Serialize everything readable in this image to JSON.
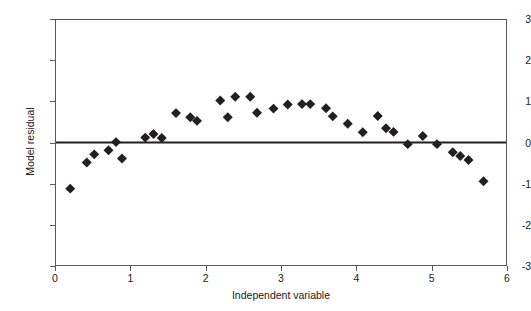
{
  "chart_data": {
    "type": "scatter",
    "title": "",
    "xlabel": "Independent variable",
    "ylabel": "Model residual",
    "xlim": [
      0,
      6
    ],
    "ylim": [
      -3,
      3
    ],
    "xticks": [
      0,
      1,
      2,
      3,
      4,
      5,
      6
    ],
    "yticks": [
      -3,
      -2,
      -1,
      0,
      1,
      2,
      3
    ],
    "xtick_labels": [
      "0",
      "1",
      "2",
      "3",
      "4",
      "5",
      "6"
    ],
    "ytick_labels": [
      "-3",
      "-2",
      "-1",
      "0",
      "1",
      "2",
      "3"
    ],
    "grid": false,
    "legend": null,
    "marker": {
      "shape": "diamond",
      "color": "#231f20",
      "size": 5
    },
    "reference_line": {
      "name": "zero-residual-line",
      "y": 0,
      "color": "#231f20",
      "width": 2
    },
    "series": [
      {
        "name": "Model residuals",
        "points": [
          [
            0.19,
            -1.13
          ],
          [
            0.41,
            -0.49
          ],
          [
            0.51,
            -0.29
          ],
          [
            0.7,
            -0.19
          ],
          [
            0.8,
            0.01
          ],
          [
            0.88,
            -0.39
          ],
          [
            1.19,
            0.12
          ],
          [
            1.3,
            0.21
          ],
          [
            1.41,
            0.11
          ],
          [
            1.6,
            0.72
          ],
          [
            1.79,
            0.62
          ],
          [
            1.88,
            0.53
          ],
          [
            2.19,
            1.03
          ],
          [
            2.29,
            0.62
          ],
          [
            2.39,
            1.12
          ],
          [
            2.59,
            1.12
          ],
          [
            2.68,
            0.73
          ],
          [
            2.9,
            0.83
          ],
          [
            3.09,
            0.93
          ],
          [
            3.28,
            0.94
          ],
          [
            3.39,
            0.94
          ],
          [
            3.6,
            0.84
          ],
          [
            3.69,
            0.64
          ],
          [
            3.89,
            0.46
          ],
          [
            4.09,
            0.25
          ],
          [
            4.29,
            0.65
          ],
          [
            4.4,
            0.35
          ],
          [
            4.5,
            0.26
          ],
          [
            4.69,
            -0.04
          ],
          [
            4.89,
            0.16
          ],
          [
            5.08,
            -0.04
          ],
          [
            5.29,
            -0.24
          ],
          [
            5.39,
            -0.33
          ],
          [
            5.5,
            -0.43
          ],
          [
            5.7,
            -0.95
          ]
        ]
      }
    ]
  },
  "figure": {
    "background_color": "#ffffff",
    "frame_color": "#58585a"
  }
}
